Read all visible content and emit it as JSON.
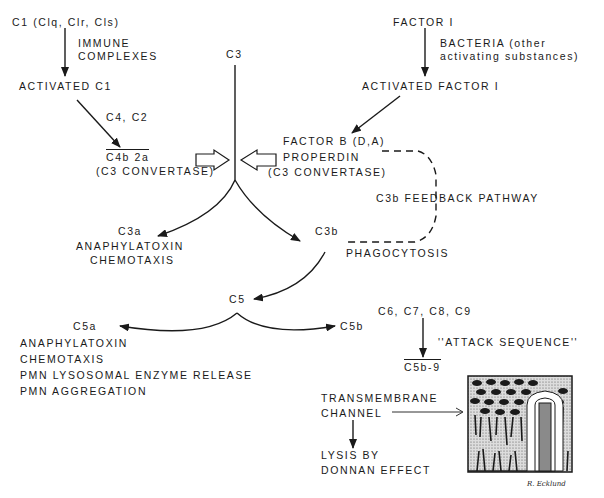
{
  "diagram": {
    "classical": {
      "c1": "C1  (Clq, Clr, Cls)",
      "immune_1": "IMMUNE",
      "immune_2": "COMPLEXES",
      "activated_c1": "ACTIVATED C1",
      "c4_c2": "C4, C2",
      "c4b2a": "C4b 2a",
      "convertase": "(C3 CONVERTASE)"
    },
    "alternative": {
      "factor": "FACTOR I",
      "bacteria_1": "BACTERIA (other",
      "bacteria_2": "activating substances)",
      "activated_factor": "ACTIVATED FACTOR I",
      "factor_b": "FACTOR B (D,A)",
      "properdin": "PROPERDIN",
      "convertase": "(C3 CONVERTASE)",
      "feedback": "C3b FEEDBACK PATHWAY"
    },
    "c3": {
      "label": "C3",
      "c3a": "C3a",
      "c3a_effect_1": "ANAPHYLATOXIN",
      "c3a_effect_2": "CHEMOTAXIS",
      "c3b": "C3b",
      "phagocytosis": "PHAGOCYTOSIS"
    },
    "c5": {
      "label": "C5",
      "c5a": "C5a",
      "c5a_effects": [
        "ANAPHYLATOXIN",
        "CHEMOTAXIS",
        "PMN LYSOSOMAL ENZYME RELEASE",
        "PMN AGGREGATION"
      ],
      "c5b": "C5b"
    },
    "attack": {
      "components": "C6, C7, C8, C9",
      "sequence": "''ATTACK SEQUENCE''",
      "complex": "C5b-9",
      "channel_1": "TRANSMEMBRANE",
      "channel_2": "CHANNEL",
      "lysis_1": "LYSIS BY",
      "lysis_2": "DONNAN EFFECT"
    },
    "signature": "R. Ecklund",
    "colors": {
      "ink": "#1a1a1a",
      "background": "#ffffff"
    }
  }
}
